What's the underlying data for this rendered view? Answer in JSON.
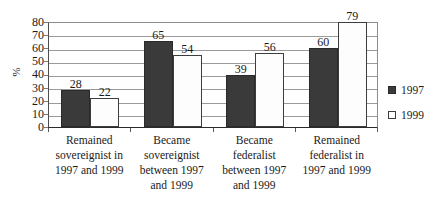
{
  "chart_data": {
    "type": "bar",
    "title": "",
    "subtitle": "",
    "xlabel": "",
    "ylabel": "%",
    "ylim": [
      0,
      80
    ],
    "ytick_step": 10,
    "yticks": [
      80,
      70,
      60,
      50,
      40,
      30,
      20,
      10,
      0
    ],
    "grid": true,
    "grid_axis": "y",
    "legend_position": "right",
    "categories": [
      "Remained sovereignist in 1997 and 1999",
      "Became sovereignist between 1997 and 1999",
      "Became federalist between 1997 and 1999",
      "Remained federalist in 1997 and 1999"
    ],
    "category_lines": [
      [
        "Remained",
        "sovereignist in",
        "1997 and 1999"
      ],
      [
        "Became",
        "sovereignist",
        "between 1997",
        "and 1999"
      ],
      [
        "Became",
        "federalist",
        "between 1997",
        "and 1999"
      ],
      [
        "Remained",
        "federalist in",
        "1997 and 1999"
      ]
    ],
    "series": [
      {
        "name": "1997",
        "color": "#3a3a3a",
        "values": [
          28,
          65,
          39,
          60
        ],
        "labels": [
          "28",
          "65",
          "39",
          "60"
        ]
      },
      {
        "name": "1999",
        "color": "#ffffff",
        "values": [
          22,
          54,
          56,
          79
        ],
        "labels": [
          "22",
          "54",
          "56",
          "79"
        ]
      }
    ]
  },
  "legend": {
    "items": [
      {
        "label": "1997",
        "swatch": "filled-dark-square"
      },
      {
        "label": "1999",
        "swatch": "open-white-square"
      }
    ]
  },
  "axis": {
    "y_title": "%",
    "y_tick_labels": [
      "80",
      "70",
      "60",
      "50",
      "40",
      "30",
      "20",
      "10",
      "0"
    ]
  },
  "colors": {
    "series_1997": "#3a3a3a",
    "series_1999": "#ffffff",
    "gridline": "#9a9a9a",
    "axis": "#2b2b2b",
    "text": "#1a1a1a",
    "background": "#ffffff"
  }
}
